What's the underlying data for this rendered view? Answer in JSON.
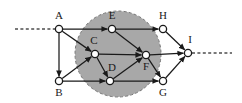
{
  "figure": {
    "background_color": "#ffffff",
    "region_fill_color": "#a8a8a8",
    "edge_color": "#1a1a1a",
    "node_fill_color": "#ffffff",
    "node_stroke_color": "#1a1a1a",
    "dashed_color": "#4d4d4d"
  },
  "chart_data": {
    "type": "diagram",
    "title": "",
    "nodes": [
      {
        "id": "A",
        "label": "A",
        "x": 59,
        "y": 29,
        "label_x": 59,
        "label_y": 19,
        "inside_region": false
      },
      {
        "id": "B",
        "label": "B",
        "x": 59,
        "y": 81,
        "label_x": 59,
        "label_y": 96,
        "inside_region": false
      },
      {
        "id": "C",
        "label": "C",
        "x": 95,
        "y": 54,
        "label_x": 94,
        "label_y": 44,
        "inside_region": true
      },
      {
        "id": "D",
        "label": "D",
        "x": 110,
        "y": 81,
        "label_x": 112,
        "label_y": 71,
        "inside_region": true
      },
      {
        "id": "E",
        "label": "E",
        "x": 112,
        "y": 29,
        "label_x": 112,
        "label_y": 19,
        "inside_region": true
      },
      {
        "id": "F",
        "label": "F",
        "x": 146,
        "y": 55,
        "label_x": 146,
        "label_y": 70,
        "inside_region": true
      },
      {
        "id": "G",
        "label": "G",
        "x": 163,
        "y": 81,
        "label_x": 163,
        "label_y": 96,
        "inside_region": false
      },
      {
        "id": "H",
        "label": "H",
        "x": 163,
        "y": 29,
        "label_x": 163,
        "label_y": 19,
        "inside_region": false
      },
      {
        "id": "I",
        "label": "I",
        "x": 188,
        "y": 53,
        "label_x": 190,
        "label_y": 43,
        "inside_region": false
      }
    ],
    "node_radius": 3.6,
    "edges": [
      {
        "from": "A",
        "to": "E",
        "directed": true
      },
      {
        "from": "A",
        "to": "C",
        "directed": true
      },
      {
        "from": "A",
        "to": "B",
        "directed": true
      },
      {
        "from": "B",
        "to": "C",
        "directed": true
      },
      {
        "from": "B",
        "to": "D",
        "directed": true
      },
      {
        "from": "C",
        "to": "D",
        "directed": true
      },
      {
        "from": "C",
        "to": "F",
        "directed": true
      },
      {
        "from": "D",
        "to": "F",
        "directed": true
      },
      {
        "from": "E",
        "to": "F",
        "directed": true
      },
      {
        "from": "E",
        "to": "H",
        "directed": true
      },
      {
        "from": "F",
        "to": "I",
        "directed": true
      },
      {
        "from": "F",
        "to": "G",
        "directed": true
      },
      {
        "from": "D",
        "to": "G",
        "directed": true
      },
      {
        "from": "H",
        "to": "I",
        "directed": true
      },
      {
        "from": "G",
        "to": "I",
        "directed": true
      }
    ],
    "region": {
      "shape": "circle",
      "cx": 118,
      "cy": 54,
      "r": 43,
      "fill": "#a8a8a8",
      "stroke_style": "dashed"
    },
    "dashed_connectors": [
      {
        "name": "left-inbound",
        "x1": 15,
        "y1": 29,
        "x2": 55,
        "y2": 29
      },
      {
        "name": "right-outbound",
        "x1": 192,
        "y1": 53,
        "x2": 232,
        "y2": 53
      }
    ]
  }
}
